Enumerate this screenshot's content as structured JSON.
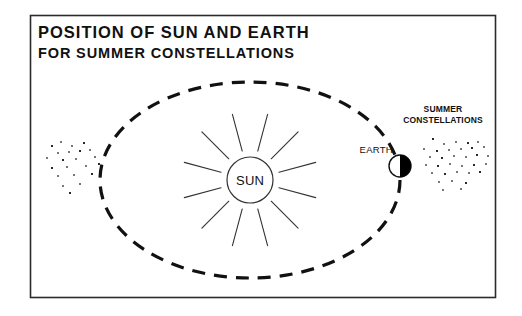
{
  "figure": {
    "title_line_1_lead": "P",
    "title_line_1_rest_a": "OSITION OF ",
    "title_line_1": "POSITION OF SUN AND EARTH",
    "title_line_2": "FOR SUMMER CONSTELLATIONS",
    "frame_color": "#2b2b2b",
    "background_color": "#ffffff",
    "ink_color": "#111111"
  },
  "labels": {
    "sun": "SUN",
    "earth": "EARTH",
    "constellations_line_1": "SUMMER",
    "constellations_line_2": "CONSTELLATIONS"
  },
  "diagram_data": {
    "type": "diagram",
    "subject": "Position of Sun and Earth for summer constellations",
    "frame": {
      "x": 30,
      "y": 15,
      "width": 465,
      "height": 282
    },
    "orbit": {
      "shape": "ellipse",
      "center_x": 250,
      "center_y": 180,
      "radius_x": 150,
      "radius_y": 98,
      "style": "dashed",
      "dash_pattern": "13 9",
      "stroke_width": 3.2
    },
    "sun": {
      "center_x": 250,
      "center_y": 180,
      "radius": 23,
      "ray_count": 12,
      "ray_inner_offset": 7,
      "ray_length": 38,
      "ray_start_angle_deg": 15
    },
    "earth": {
      "center_x": 400,
      "center_y": 166,
      "radius": 11,
      "lit_side": "left",
      "shadow_side": "right",
      "note": "Night side faces away from Sun, toward summer constellations"
    },
    "star_field_left": {
      "label": "winter-side stars",
      "dots": [
        [
          52,
          146
        ],
        [
          61,
          142
        ],
        [
          72,
          146
        ],
        [
          84,
          143
        ],
        [
          58,
          153
        ],
        [
          69,
          152
        ],
        [
          80,
          151
        ],
        [
          90,
          150
        ],
        [
          47,
          158
        ],
        [
          63,
          160
        ],
        [
          76,
          159
        ],
        [
          95,
          157
        ],
        [
          52,
          168
        ],
        [
          67,
          167
        ],
        [
          86,
          166
        ],
        [
          99,
          164
        ],
        [
          58,
          176
        ],
        [
          74,
          175
        ],
        [
          92,
          174
        ],
        [
          63,
          186
        ],
        [
          80,
          184
        ],
        [
          70,
          193
        ]
      ]
    },
    "star_field_right": {
      "label": "summer constellations stars",
      "dots": [
        [
          433,
          139
        ],
        [
          444,
          144
        ],
        [
          456,
          142
        ],
        [
          468,
          143
        ],
        [
          478,
          142
        ],
        [
          424,
          149
        ],
        [
          437,
          151
        ],
        [
          449,
          150
        ],
        [
          461,
          149
        ],
        [
          472,
          148
        ],
        [
          484,
          147
        ],
        [
          430,
          157
        ],
        [
          442,
          158
        ],
        [
          454,
          156
        ],
        [
          466,
          157
        ],
        [
          477,
          155
        ],
        [
          488,
          156
        ],
        [
          426,
          165
        ],
        [
          438,
          166
        ],
        [
          450,
          164
        ],
        [
          462,
          166
        ],
        [
          474,
          165
        ],
        [
          486,
          164
        ],
        [
          432,
          173
        ],
        [
          445,
          174
        ],
        [
          457,
          172
        ],
        [
          469,
          173
        ],
        [
          480,
          172
        ],
        [
          439,
          182
        ],
        [
          452,
          181
        ],
        [
          466,
          183
        ],
        [
          443,
          190
        ],
        [
          461,
          189
        ]
      ]
    },
    "title_position": {
      "x": 38,
      "line_1_baseline": 38,
      "line_2_baseline": 58
    },
    "label_positions": {
      "sun": [
        250,
        185
      ],
      "earth": [
        393,
        153
      ],
      "constellations": [
        443,
        112
      ]
    }
  }
}
